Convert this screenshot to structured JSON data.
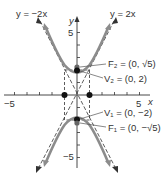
{
  "diagram": {
    "title": "",
    "asymptotes": [
      {
        "label": "y = −2x",
        "slope": -2
      },
      {
        "label": "y = 2x",
        "slope": 2
      }
    ],
    "axes": {
      "x_label": "x",
      "y_label": "y",
      "x_ticks": {
        "min": -5,
        "max": 5,
        "labeled": [
          "−5",
          "5"
        ]
      },
      "y_ticks": {
        "min": -5,
        "max": 5,
        "labeled": [
          "5",
          "−5"
        ]
      }
    },
    "points": [
      {
        "name": "F2",
        "label": "F₂ = (0, √5)",
        "x": 0,
        "y": 2.236
      },
      {
        "name": "V2",
        "label": "V₂ = (0, 2)",
        "x": 0,
        "y": 2
      },
      {
        "name": "V1",
        "label": "V₁ = (0, −2)",
        "x": 0,
        "y": -2
      },
      {
        "name": "F1",
        "label": "F₁ = (0, −√5)",
        "x": 0,
        "y": -2.236
      },
      {
        "name": "co-vertex-left",
        "x": -1,
        "y": 0
      },
      {
        "name": "co-vertex-right",
        "x": 1,
        "y": 0
      }
    ],
    "hyperbola": "y²/4 − x² = 1",
    "colors": {
      "curve": "#8c8c8c",
      "axis": "#333333",
      "point": "#111111",
      "focus": "#666666"
    }
  }
}
